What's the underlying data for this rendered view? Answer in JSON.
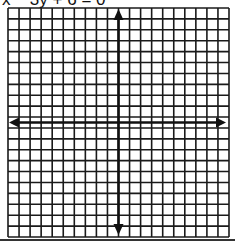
{
  "problem": {
    "label": "x − 3y + 6 = 0",
    "equation": "x − 3y + 6 = 0"
  },
  "grid": {
    "columns": 20,
    "rows": 21,
    "line_color": "#1a1a1a",
    "axis_color": "#111111",
    "background": "#ffffff"
  },
  "axes": {
    "x_axis": "horizontal arrowed axis",
    "y_axis": "vertical arrowed axis"
  }
}
